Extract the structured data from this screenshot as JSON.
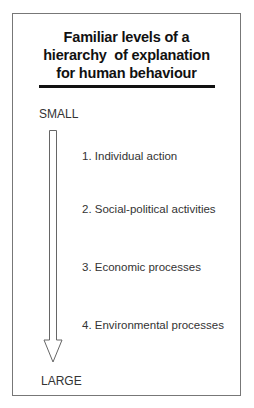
{
  "diagram": {
    "title_lines": [
      "Familiar levels of a",
      "hierarchy  of explanation",
      "for human behaviour"
    ],
    "scale": {
      "top_label": "SMALL",
      "bottom_label": "LARGE",
      "direction": "down-arrow"
    },
    "levels": [
      {
        "number": "1.",
        "label": "Individual action",
        "text": "1. Individual action"
      },
      {
        "number": "2.",
        "label": "Social-political activities",
        "text": "2. Social-political activities"
      },
      {
        "number": "3.",
        "label": "Economic processes",
        "text": "3. Economic processes"
      },
      {
        "number": "4.",
        "label": "Environmental processes",
        "text": "4. Environmental processes"
      }
    ],
    "colors": {
      "text": "#333333",
      "title": "#111111",
      "rule": "#111111",
      "border": "#777777"
    }
  }
}
